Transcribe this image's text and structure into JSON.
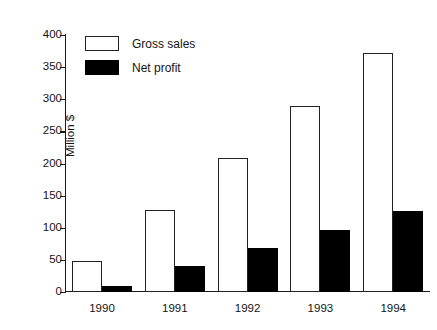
{
  "top_fragment": {
    "visible_text": "",
    "note": "cropped text line at image top edge, illegible"
  },
  "legend": {
    "position": "inside-top-left",
    "items": [
      {
        "label": "Gross sales",
        "swatch": "white-outlined-rect"
      },
      {
        "label": "Net profit",
        "swatch": "black-filled-rect"
      }
    ]
  },
  "axes": {
    "y_title": "Million $",
    "y_ticks": [
      "0",
      "50",
      "100",
      "150",
      "200",
      "250",
      "300",
      "350",
      "400"
    ],
    "x_ticks": [
      "1990",
      "1991",
      "1992",
      "1993",
      "1994"
    ]
  },
  "colors": {
    "gross_fill": "#ffffff",
    "gross_edge": "#222222",
    "net_fill": "#000000",
    "axis": "#1b1b1b",
    "text": "#141414",
    "background": "#ffffff"
  },
  "chart_data": {
    "type": "bar",
    "title": "",
    "subtitle": "",
    "xlabel": "",
    "ylabel": "Million $",
    "categories": [
      "1990",
      "1991",
      "1992",
      "1993",
      "1994"
    ],
    "series": [
      {
        "name": "Gross sales",
        "values": [
          48,
          128,
          209,
          290,
          372
        ]
      },
      {
        "name": "Net profit",
        "values": [
          10,
          41,
          68,
          97,
          126
        ]
      }
    ],
    "ylim": [
      0,
      400
    ],
    "ytick_step": 50,
    "grid": false,
    "legend_position": "upper left inside axes",
    "bar_style": "grouped-adjacent-pairs"
  }
}
